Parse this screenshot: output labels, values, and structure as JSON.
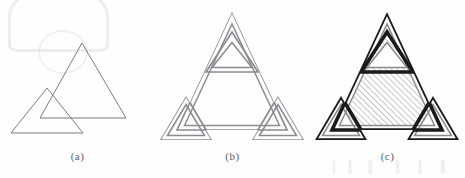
{
  "figure": {
    "background_color": "#fefefe",
    "panels": [
      {
        "id": "a",
        "caption": "(a)",
        "description": "Two overlapping plain outline triangles",
        "stroke_color": "#6e6e73",
        "stroke_width": 0.9,
        "fill": "none",
        "shapes": [
          {
            "name": "small-triangle",
            "points": "11,133 47,88 83,133"
          },
          {
            "name": "large-triangle",
            "points": "40,118 82,43 126,118"
          }
        ]
      },
      {
        "id": "b",
        "caption": "(b)",
        "description": "Outline of the union of four triangles drawn as thin double contours",
        "stroke_color": "#8a8a90",
        "stroke_width": 0.85,
        "inner_offset": 3,
        "fill": "none",
        "shapes": [
          {
            "name": "large-triangle",
            "points": "22,130 77,12 132,130"
          },
          {
            "name": "top-small-triangle",
            "points": "51,72 77,32 103,72"
          },
          {
            "name": "left-small-triangle",
            "points": "5,140 31,96 57,140"
          },
          {
            "name": "right-small-triangle",
            "points": "97,140 123,96 149,140"
          }
        ]
      },
      {
        "id": "c",
        "caption": "(c)",
        "description": "Same union with bold outer contour and diagonal hatching filling the large triangle",
        "stroke_color": "#1a1a1a",
        "inner_stroke_color": "#8a8a90",
        "stroke_width": 2.0,
        "inner_stroke_width": 0.85,
        "hatch": {
          "color": "#7a7a80",
          "angle_deg": 45,
          "spacing_px": 4.2,
          "line_width": 0.8
        },
        "shapes": [
          {
            "name": "large-triangle",
            "points": "22,130 77,12 132,130"
          },
          {
            "name": "top-small-triangle",
            "points": "51,72 77,32 103,72"
          },
          {
            "name": "left-small-triangle",
            "points": "5,140 31,96 57,140"
          },
          {
            "name": "right-small-triangle",
            "points": "97,140 123,96 149,140"
          }
        ]
      }
    ]
  }
}
